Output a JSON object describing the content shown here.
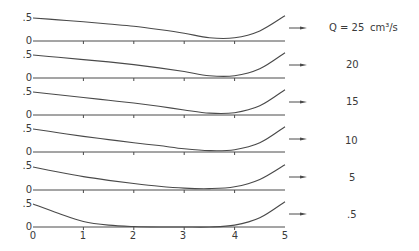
{
  "chart_data": {
    "type": "line",
    "title": "",
    "xlabel": "",
    "ylabel": "",
    "xlim": [
      0,
      5
    ],
    "ylim_per_panel": [
      0,
      0.5
    ],
    "x_ticks": [
      "0",
      "1",
      "2",
      "3",
      "4",
      "5"
    ],
    "y_ticks": [
      "0",
      ".5"
    ],
    "grid": false,
    "legend_position": "right, one label per panel with arrow",
    "unit_label": "cm 3/s",
    "x": [
      0,
      0.5,
      1,
      1.5,
      2,
      2.5,
      3,
      3.5,
      4,
      4.5,
      5
    ],
    "panels": [
      {
        "label": "Q = 25",
        "unit": "cm³/s",
        "values": [
          0.5,
          0.46,
          0.42,
          0.37,
          0.32,
          0.25,
          0.17,
          0.07,
          0.07,
          0.22,
          0.55
        ]
      },
      {
        "label": "20",
        "unit": "",
        "values": [
          0.5,
          0.45,
          0.4,
          0.35,
          0.29,
          0.22,
          0.14,
          0.05,
          0.05,
          0.2,
          0.55
        ]
      },
      {
        "label": "15",
        "unit": "",
        "values": [
          0.5,
          0.44,
          0.38,
          0.32,
          0.26,
          0.19,
          0.11,
          0.04,
          0.05,
          0.2,
          0.55
        ]
      },
      {
        "label": "10",
        "unit": "",
        "values": [
          0.5,
          0.42,
          0.34,
          0.27,
          0.2,
          0.14,
          0.07,
          0.03,
          0.05,
          0.2,
          0.55
        ]
      },
      {
        "label": "5",
        "unit": "",
        "values": [
          0.5,
          0.39,
          0.29,
          0.21,
          0.14,
          0.08,
          0.04,
          0.03,
          0.07,
          0.23,
          0.55
        ]
      },
      {
        "label": ".5",
        "unit": "",
        "values": [
          0.5,
          0.3,
          0.12,
          0.04,
          0.01,
          0.0,
          0.0,
          0.0,
          0.04,
          0.2,
          0.55
        ]
      }
    ]
  },
  "legend": {
    "q25": "Q = 25",
    "unit": "cm³/s",
    "q20": "20",
    "q15": "15",
    "q10": "10",
    "q5": "5",
    "q05": ".5"
  },
  "axis": {
    "y_half": ".5",
    "y_zero": "0",
    "x0": "0",
    "x1": "1",
    "x2": "2",
    "x3": "3",
    "x4": "4",
    "x5": "5"
  }
}
